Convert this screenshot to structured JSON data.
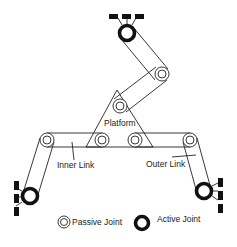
{
  "diagram": {
    "type": "parallel-mechanism",
    "labels": {
      "platform": "Platform",
      "inner_link": "Inner Link",
      "outer_link": "Outer Link"
    },
    "legend": {
      "passive": "Passive Joint",
      "active": "Active Joint"
    },
    "colors": {
      "stroke": "#222222",
      "background": "#ffffff"
    }
  }
}
